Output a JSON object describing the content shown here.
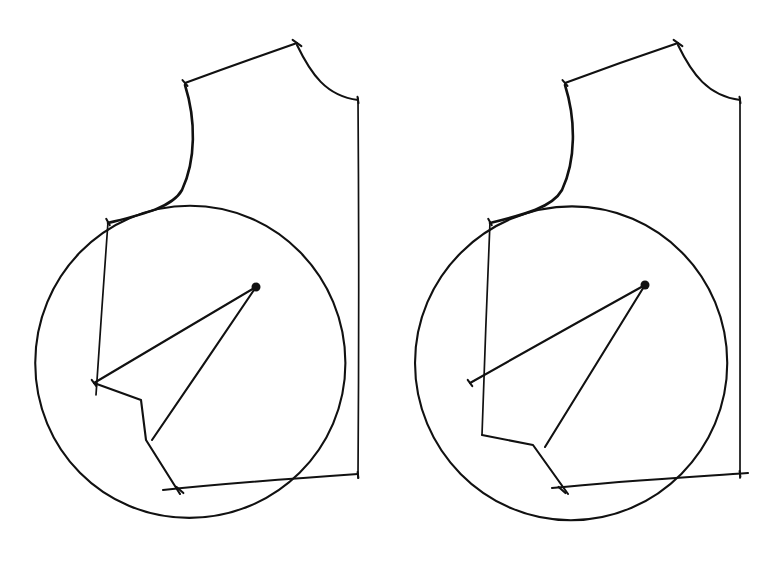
{
  "document": {
    "title": "Hand-drawn Geometric Pattern Diagram",
    "medium": "pen-on-paper line drawing",
    "background_color": "#ffffff",
    "ink_color": "#111111",
    "width": 776,
    "height": 563,
    "figure_count": 2,
    "caption": ""
  },
  "figures": [
    {
      "id": "figure-left",
      "name": "left-pattern-block",
      "label": "",
      "offset_x": 0,
      "circle": {
        "name": "main-circle",
        "cx": 190,
        "cy": 363,
        "r": 156
      },
      "apex_dot": {
        "name": "apex-point",
        "cx": 256,
        "cy": 287,
        "r": 4.5
      },
      "shoulder_line": {
        "name": "shoulder-line",
        "x1": 185,
        "y1": 83,
        "x2": 297,
        "y2": 43
      },
      "neck_curve": {
        "name": "neck-curve",
        "d": "M 297 45 C 311 74, 326 96, 358 100"
      },
      "side_curve": {
        "name": "left-side-curve",
        "d": "M 185 85 C 196 120, 196 160, 182 190 C 172 208, 140 215, 108 223"
      },
      "right_vertical": {
        "name": "right-vertical-line",
        "x1": 358,
        "y1": 98,
        "x2": 358,
        "y2": 478
      },
      "hem_curve": {
        "name": "hem-curve",
        "d": "M 163 490 C 230 483, 300 478, 358 474"
      },
      "inner_vertical": {
        "name": "inner-vertical-line",
        "x1": 108,
        "y1": 222,
        "x2": 96,
        "y2": 395
      },
      "polyline": {
        "name": "inner-polyline",
        "points": "94,383 141,400 146,440 180,494"
      },
      "ray_long": {
        "name": "long-ray-to-apex",
        "x1": 94,
        "y1": 383,
        "x2": 256,
        "y2": 287
      },
      "ray_short": {
        "name": "short-ray-to-apex",
        "x1": 152,
        "y1": 440,
        "x2": 256,
        "y2": 287
      },
      "ticks": [
        {
          "name": "tick-shoulder-left",
          "cx": 185,
          "cy": 83,
          "angle": 78,
          "len": 24
        },
        {
          "name": "tick-neck-top",
          "cx": 297,
          "cy": 43,
          "angle": 70,
          "len": 26
        },
        {
          "name": "tick-armhole-right",
          "cx": 358,
          "cy": 100,
          "angle": 88,
          "len": 26
        },
        {
          "name": "tick-side-left",
          "cx": 108,
          "cy": 222,
          "angle": 82,
          "len": 26
        },
        {
          "name": "tick-vertex-left",
          "cx": 94,
          "cy": 383,
          "angle": 80,
          "len": 26
        },
        {
          "name": "tick-hem-lower",
          "cx": 180,
          "cy": 490,
          "angle": 75,
          "len": 26
        },
        {
          "name": "tick-hem-right",
          "cx": 358,
          "cy": 475,
          "angle": 88,
          "len": 24
        }
      ]
    },
    {
      "id": "figure-right",
      "name": "right-pattern-block",
      "label": "",
      "offset_x": 380,
      "circle": {
        "name": "main-circle",
        "cx": 572,
        "cy": 363,
        "r": 156
      },
      "apex_dot": {
        "name": "apex-point",
        "cx": 645,
        "cy": 285,
        "r": 4.5
      },
      "shoulder_line": {
        "name": "shoulder-line",
        "x1": 565,
        "y1": 83,
        "x2": 678,
        "y2": 43
      },
      "neck_curve": {
        "name": "neck-curve",
        "d": "M 678 45 C 692 74, 708 96, 740 100"
      },
      "side_curve": {
        "name": "left-side-curve",
        "d": "M 565 85 C 576 120, 576 160, 562 190 C 552 208, 522 215, 490 223"
      },
      "right_vertical": {
        "name": "right-vertical-line",
        "x1": 740,
        "y1": 98,
        "x2": 740,
        "y2": 478
      },
      "hem_curve": {
        "name": "hem-curve",
        "d": "M 552 488 C 620 481, 690 477, 748 473"
      },
      "inner_vertical": {
        "name": "inner-vertical-line",
        "x1": 490,
        "y1": 222,
        "x2": 482,
        "y2": 435
      },
      "polyline": {
        "name": "inner-polyline",
        "points": "482,435 533,445 568,494"
      },
      "ray_long": {
        "name": "long-ray-to-apex",
        "x1": 470,
        "y1": 383,
        "x2": 645,
        "y2": 285
      },
      "ray_short": {
        "name": "short-ray-to-apex",
        "x1": 545,
        "y1": 447,
        "x2": 645,
        "y2": 285
      },
      "ticks": [
        {
          "name": "tick-shoulder-left",
          "cx": 565,
          "cy": 83,
          "angle": 78,
          "len": 24
        },
        {
          "name": "tick-neck-top",
          "cx": 678,
          "cy": 43,
          "angle": 70,
          "len": 26
        },
        {
          "name": "tick-armhole-right",
          "cx": 740,
          "cy": 100,
          "angle": 88,
          "len": 26
        },
        {
          "name": "tick-side-left",
          "cx": 490,
          "cy": 222,
          "angle": 82,
          "len": 26
        },
        {
          "name": "tick-vertex-left",
          "cx": 470,
          "cy": 383,
          "angle": 80,
          "len": 26
        },
        {
          "name": "tick-hem-lower",
          "cx": 562,
          "cy": 490,
          "angle": 75,
          "len": 26
        },
        {
          "name": "tick-hem-right",
          "cx": 740,
          "cy": 474,
          "angle": 88,
          "len": 24
        }
      ]
    }
  ]
}
